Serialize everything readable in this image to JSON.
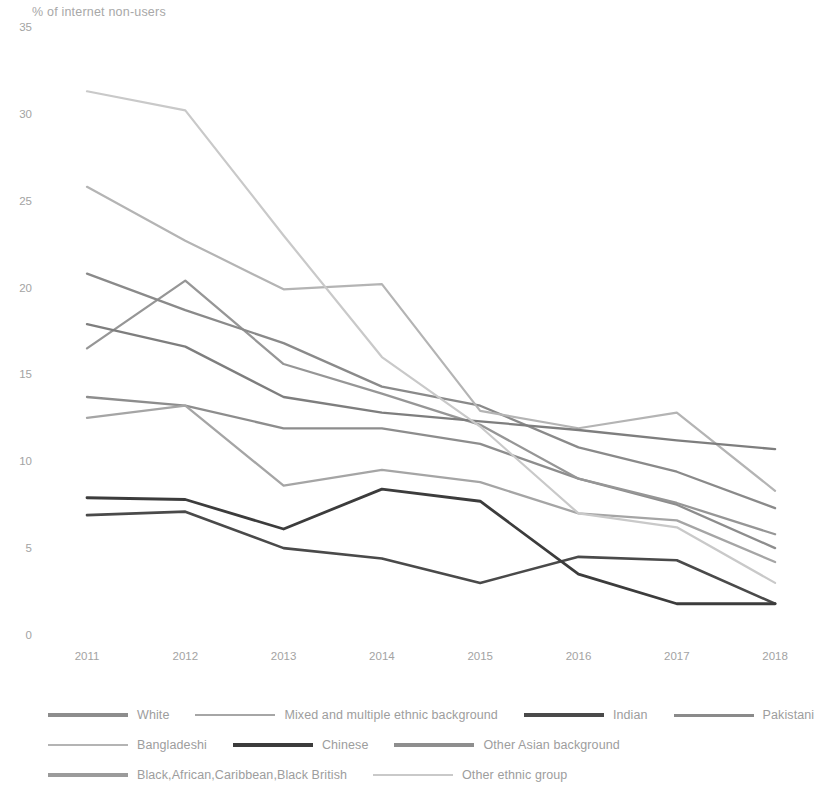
{
  "chart_data": {
    "type": "line",
    "title": "% of internet non-users",
    "xlabel": "",
    "ylabel": "",
    "grid": false,
    "legend_position": "bottom",
    "x": [
      "2011",
      "2012",
      "2013",
      "2014",
      "2015",
      "2016",
      "2017",
      "2018"
    ],
    "xlim": [
      2011,
      2018
    ],
    "ylim": [
      0,
      35
    ],
    "y_ticks": [
      "0",
      "5",
      "10",
      "15",
      "20",
      "25",
      "30",
      "35"
    ],
    "series": [
      {
        "name": "White",
        "color": "#8d8d8d",
        "width": 2.3,
        "values": [
          13.7,
          13.2,
          11.9,
          11.9,
          11.0,
          9.0,
          7.5,
          5.0
        ]
      },
      {
        "name": "Mixed and multiple ethnic background",
        "color": "#969696",
        "width": 2.3,
        "values": [
          16.5,
          20.4,
          15.6,
          13.9,
          12.1,
          9.0,
          7.6,
          5.8
        ]
      },
      {
        "name": "Indian",
        "color": "#4a4a4a",
        "width": 2.6,
        "values": [
          6.9,
          7.1,
          5.0,
          4.4,
          3.0,
          4.5,
          4.3,
          1.8
        ]
      },
      {
        "name": "Pakistani",
        "color": "#8a8a8a",
        "width": 2.3,
        "values": [
          20.8,
          18.7,
          16.8,
          14.3,
          13.2,
          10.8,
          9.4,
          7.3
        ]
      },
      {
        "name": "Bangladeshi",
        "color": "#b4b4b4",
        "width": 2.2,
        "values": [
          25.8,
          22.7,
          19.9,
          20.2,
          12.9,
          11.9,
          12.8,
          8.3
        ]
      },
      {
        "name": "Chinese",
        "color": "#3c3c3c",
        "width": 2.8,
        "values": [
          7.9,
          7.8,
          6.1,
          8.4,
          7.7,
          3.5,
          1.8,
          1.8
        ]
      },
      {
        "name": "Other Asian background",
        "color": "#7e7e7e",
        "width": 2.3,
        "values": [
          17.9,
          16.6,
          13.7,
          12.8,
          12.3,
          11.8,
          11.2,
          10.7
        ]
      },
      {
        "name": "Black,African,Caribbean,Black British",
        "color": "#a5a5a5",
        "width": 2.3,
        "values": [
          12.5,
          13.2,
          8.6,
          9.5,
          8.8,
          7.0,
          6.6,
          4.2
        ]
      },
      {
        "name": "Other ethnic group",
        "color": "#c9c9c9",
        "width": 2.2,
        "values": [
          31.3,
          30.2,
          23.0,
          16.0,
          12.0,
          7.0,
          6.2,
          3.0
        ]
      }
    ]
  },
  "legend": {
    "rows": [
      [
        {
          "name": "White",
          "color": "#8d8d8d",
          "width": 3.2
        },
        {
          "name": "Mixed and multiple ethnic background",
          "color": "#a6a6a6",
          "width": 2.6
        },
        {
          "name": "Indian",
          "color": "#4a4a4a",
          "width": 4.2
        },
        {
          "name": "Pakistani",
          "color": "#8a8a8a",
          "width": 3.0
        }
      ],
      [
        {
          "name": "Bangladeshi",
          "color": "#b4b4b4",
          "width": 2.6
        },
        {
          "name": "Chinese",
          "color": "#3c3c3c",
          "width": 4.4
        },
        {
          "name": "Other Asian background",
          "color": "#8e8e8e",
          "width": 3.2
        }
      ],
      [
        {
          "name": "Black,African,Caribbean,Black British",
          "color": "#9b9b9b",
          "width": 3.4
        },
        {
          "name": "Other ethnic group",
          "color": "#c9c9c9",
          "width": 2.6
        }
      ]
    ]
  }
}
